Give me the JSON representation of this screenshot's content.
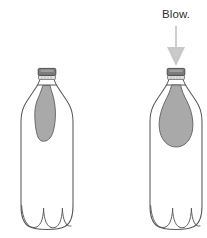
{
  "figure": {
    "title_visible": false,
    "background_color": "#ffffff",
    "width": 207,
    "height": 238
  },
  "annotation": {
    "label": "Blow.",
    "label_color": "#2f2f33",
    "arrow": {
      "name": "blow-arrow",
      "direction": "down",
      "color": "#c9c9c9",
      "shaft_x": 176,
      "shaft_top_y": 26,
      "shaft_bottom_y": 48,
      "head_tip_y": 66,
      "head_half_width": 9
    }
  },
  "colors": {
    "bottle_outline": "#58585b",
    "bottle_fill": "#ffffff",
    "balloon_fill": "#a9a9a9",
    "balloon_outline": "#5f5f62",
    "cap_top_fill": "#7c7c7f",
    "cap_top_outline": "#4a4a4d",
    "neck_ring_fill": "#e3e3e3",
    "neck_ring_outline": "#6a6a6d",
    "arrow_gray": "#c9c9c9",
    "text_gray": "#2f2f33"
  },
  "bottles": [
    {
      "id": "bottle-left",
      "name": "bottle-deflated",
      "state": "deflated",
      "center_x": 47,
      "cap": {
        "name": "bottle-cap",
        "present": true
      },
      "balloon": {
        "name": "balloon-deflated",
        "inflated": false
      },
      "base_lobes": 3,
      "annotated": false
    },
    {
      "id": "bottle-right",
      "name": "bottle-inflated",
      "state": "inflated",
      "center_x": 176,
      "cap": {
        "name": "bottle-cap",
        "present": true
      },
      "balloon": {
        "name": "balloon-inflated",
        "inflated": true
      },
      "base_lobes": 3,
      "annotated": true
    }
  ]
}
